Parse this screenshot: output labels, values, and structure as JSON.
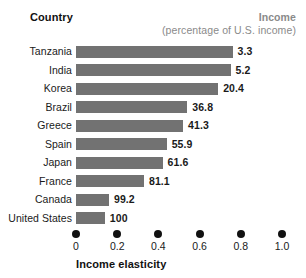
{
  "header": {
    "country_label": "Country",
    "income_label": "Income",
    "income_sublabel": "(percentage of U.S. income)"
  },
  "axis": {
    "title": "Income elasticity",
    "ticks": [
      "0",
      "0.2",
      "0.4",
      "0.6",
      "0.8",
      "1.0"
    ]
  },
  "colors": {
    "bar": "#727272",
    "header_gray": "#8a8a8a",
    "text": "#1a1a1a"
  },
  "chart_data": {
    "type": "bar",
    "orientation": "horizontal",
    "title": "",
    "xlabel": "Income elasticity",
    "ylabel": "Country",
    "xlim": [
      0,
      1.0
    ],
    "xticks": [
      0,
      0.2,
      0.4,
      0.6,
      0.8,
      1.0
    ],
    "grid": false,
    "legend": null,
    "categories": [
      "Tanzania",
      "India",
      "Korea",
      "Brazil",
      "Greece",
      "Spain",
      "Japan",
      "France",
      "Canada",
      "United States"
    ],
    "values": [
      0.76,
      0.75,
      0.69,
      0.54,
      0.52,
      0.44,
      0.42,
      0.33,
      0.16,
      0.14
    ],
    "annotations": {
      "name": "Income (percentage of U.S. income)",
      "labels": [
        "3.3",
        "5.2",
        "20.4",
        "36.8",
        "41.3",
        "55.9",
        "61.6",
        "81.1",
        "99.2",
        "100"
      ]
    },
    "rows": [
      {
        "country": "Tanzania",
        "elasticity": 0.76,
        "income_pct": "3.3"
      },
      {
        "country": "India",
        "elasticity": 0.75,
        "income_pct": "5.2"
      },
      {
        "country": "Korea",
        "elasticity": 0.69,
        "income_pct": "20.4"
      },
      {
        "country": "Brazil",
        "elasticity": 0.54,
        "income_pct": "36.8"
      },
      {
        "country": "Greece",
        "elasticity": 0.52,
        "income_pct": "41.3"
      },
      {
        "country": "Spain",
        "elasticity": 0.44,
        "income_pct": "55.9"
      },
      {
        "country": "Japan",
        "elasticity": 0.42,
        "income_pct": "61.6"
      },
      {
        "country": "France",
        "elasticity": 0.33,
        "income_pct": "81.1"
      },
      {
        "country": "Canada",
        "elasticity": 0.16,
        "income_pct": "99.2"
      },
      {
        "country": "United States",
        "elasticity": 0.14,
        "income_pct": "100"
      }
    ]
  }
}
